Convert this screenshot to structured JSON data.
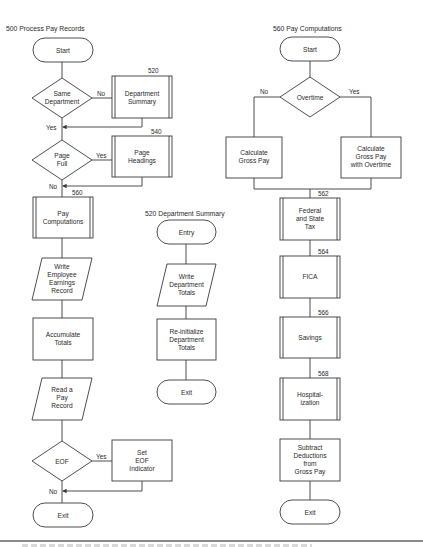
{
  "charts": {
    "process_pay_records": {
      "title": "500 Process Pay Records",
      "start": "Start",
      "decision_same_department": [
        "Same",
        "Department"
      ],
      "same_department_no": "No",
      "same_department_yes": "Yes",
      "department_summary_ref": "520",
      "department_summary": [
        "Department",
        "Summary"
      ],
      "decision_page_full": [
        "Page",
        "Full"
      ],
      "page_full_yes": "Yes",
      "page_full_no": "No",
      "page_headings_ref": "540",
      "page_headings": [
        "Page",
        "Headings"
      ],
      "pay_computations_ref": "560",
      "pay_computations": [
        "Pay",
        "Computations"
      ],
      "write_record": [
        "Write",
        "Employee",
        "Earnings",
        "Record"
      ],
      "accumulate_totals": [
        "Accumulate",
        "Totals"
      ],
      "read_record": [
        "Read a",
        "Pay",
        "Record"
      ],
      "decision_eof": "EOF",
      "eof_yes": "Yes",
      "eof_no": "No",
      "set_eof": [
        "Set",
        "EOF",
        "Indicator"
      ],
      "exit": "Exit"
    },
    "department_summary": {
      "title": "520 Department Summary",
      "entry": "Entry",
      "write_totals": [
        "Write",
        "Department",
        "Totals"
      ],
      "reinitialize": [
        "Re-initialize",
        "Department",
        "Totals"
      ],
      "exit": "Exit"
    },
    "pay_computations": {
      "title": "560 Pay Computations",
      "start": "Start",
      "decision_overtime": "Overtime",
      "overtime_no": "No",
      "overtime_yes": "Yes",
      "calc_gross": [
        "Calculate",
        "Gross Pay"
      ],
      "calc_gross_ot": [
        "Calculate",
        "Gross Pay",
        "with Overtime"
      ],
      "tax_ref": "562",
      "tax": [
        "Federal",
        "and State",
        "Tax"
      ],
      "fica_ref": "564",
      "fica": "FICA",
      "savings_ref": "566",
      "savings": "Savings",
      "hosp_ref": "568",
      "hosp": [
        "Hospital-",
        "ization"
      ],
      "subtract": [
        "Subtract",
        "Deductions",
        "from",
        "Gross Pay"
      ],
      "exit": "Exit"
    }
  }
}
